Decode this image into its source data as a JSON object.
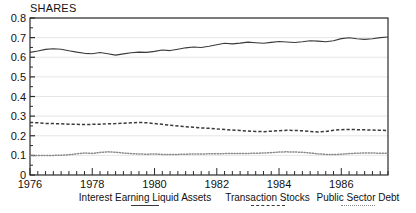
{
  "chart_data": {
    "type": "line",
    "title": "SHARES",
    "ylabel": "SHARES",
    "xlabel": "",
    "grid": true,
    "legend_position": "bottom",
    "ylim": [
      0,
      0.8
    ],
    "xlim": [
      1976.0,
      1987.5
    ],
    "ytick_labels": [
      "0.8",
      "0.7",
      "0.6",
      "0.5",
      "0.4",
      "0.3",
      "0.2",
      "0.1",
      "0"
    ],
    "ytick_values": [
      0.8,
      0.7,
      0.6,
      0.5,
      0.4,
      0.3,
      0.2,
      0.1,
      0
    ],
    "xtick_labels": [
      "1976",
      "1978",
      "1980",
      "1982",
      "1984",
      "1986"
    ],
    "xtick_values": [
      1976,
      1978,
      1980,
      1982,
      1984,
      1986
    ],
    "minor_xtick_interval": 0.25,
    "x": [
      1976.0,
      1976.25,
      1976.5,
      1976.75,
      1977.0,
      1977.25,
      1977.5,
      1977.75,
      1978.0,
      1978.25,
      1978.5,
      1978.75,
      1979.0,
      1979.25,
      1979.5,
      1979.75,
      1980.0,
      1980.25,
      1980.5,
      1980.75,
      1981.0,
      1981.25,
      1981.5,
      1981.75,
      1982.0,
      1982.25,
      1982.5,
      1982.75,
      1983.0,
      1983.25,
      1983.5,
      1983.75,
      1984.0,
      1984.25,
      1984.5,
      1984.75,
      1985.0,
      1985.25,
      1985.5,
      1985.75,
      1986.0,
      1986.25,
      1986.5,
      1986.75,
      1987.0,
      1987.25,
      1987.5
    ],
    "series": [
      {
        "name": "Interest Earning Liquid Assets",
        "style": "solid",
        "color": "#3a3a3a",
        "values": [
          0.625,
          0.632,
          0.64,
          0.643,
          0.641,
          0.633,
          0.626,
          0.62,
          0.618,
          0.624,
          0.618,
          0.611,
          0.617,
          0.623,
          0.626,
          0.625,
          0.63,
          0.637,
          0.634,
          0.641,
          0.648,
          0.652,
          0.65,
          0.656,
          0.664,
          0.671,
          0.668,
          0.672,
          0.677,
          0.674,
          0.671,
          0.676,
          0.68,
          0.678,
          0.675,
          0.679,
          0.684,
          0.682,
          0.679,
          0.684,
          0.695,
          0.699,
          0.694,
          0.691,
          0.694,
          0.7,
          0.703
        ]
      },
      {
        "name": "Transaction Stocks",
        "style": "dashed",
        "color": "#3a3a3a",
        "values": [
          0.268,
          0.266,
          0.263,
          0.262,
          0.261,
          0.259,
          0.258,
          0.257,
          0.258,
          0.259,
          0.261,
          0.262,
          0.264,
          0.266,
          0.268,
          0.266,
          0.262,
          0.258,
          0.254,
          0.25,
          0.246,
          0.243,
          0.24,
          0.238,
          0.235,
          0.232,
          0.229,
          0.227,
          0.224,
          0.222,
          0.221,
          0.223,
          0.226,
          0.228,
          0.227,
          0.225,
          0.222,
          0.219,
          0.222,
          0.228,
          0.231,
          0.232,
          0.231,
          0.23,
          0.229,
          0.228,
          0.227
        ]
      },
      {
        "name": "Public Sector Debt",
        "style": "dotted",
        "color": "#8a8a8a",
        "values": [
          0.098,
          0.099,
          0.1,
          0.1,
          0.101,
          0.103,
          0.108,
          0.112,
          0.11,
          0.115,
          0.118,
          0.116,
          0.112,
          0.109,
          0.107,
          0.106,
          0.107,
          0.105,
          0.104,
          0.105,
          0.106,
          0.107,
          0.107,
          0.108,
          0.108,
          0.109,
          0.109,
          0.11,
          0.11,
          0.111,
          0.112,
          0.114,
          0.117,
          0.118,
          0.117,
          0.116,
          0.112,
          0.108,
          0.105,
          0.104,
          0.106,
          0.109,
          0.111,
          0.112,
          0.112,
          0.111,
          0.11
        ]
      }
    ]
  },
  "legend": {
    "entries": [
      {
        "label": "Interest Earning Liquid Assets",
        "style": "solid"
      },
      {
        "label": "Transaction Stocks",
        "style": "dashed"
      },
      {
        "label": "Public Sector Debt",
        "style": "dotted"
      }
    ]
  },
  "colors": {
    "frame": "#2b2b2b",
    "grid": "#e6e6e6",
    "series_solid": "#3a3a3a",
    "series_dashed": "#3a3a3a",
    "series_dotted": "#8a8a8a",
    "background": "#ffffff"
  }
}
